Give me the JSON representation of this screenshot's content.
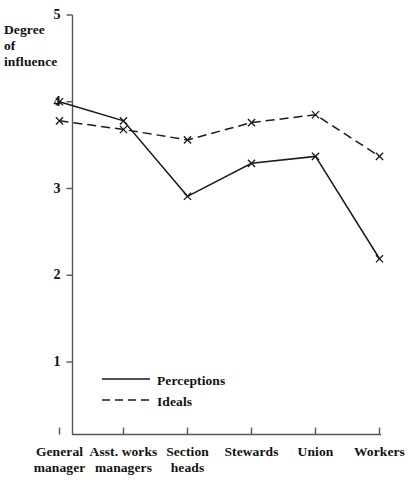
{
  "chart_data": {
    "type": "line",
    "title": "",
    "subtitle": "",
    "xlabel": "",
    "ylabel": "Degree\nof\ninfluence",
    "ylabel_lines": [
      "Degree",
      "of",
      "influence"
    ],
    "categories": [
      "General\nmanager",
      "Asst. works\nmanagers",
      "Section\nheads",
      "Stewards",
      "Union",
      "Workers"
    ],
    "category_lines": [
      [
        "General",
        "manager"
      ],
      [
        "Asst. works",
        "managers"
      ],
      [
        "Section",
        "heads"
      ],
      [
        "Stewards"
      ],
      [
        "Union"
      ],
      [
        "Workers"
      ]
    ],
    "yticks": [
      1,
      2,
      3,
      4,
      5
    ],
    "ytick_labels": [
      "1",
      "2",
      "3",
      "4",
      "5"
    ],
    "ylim": [
      0.55,
      5.0
    ],
    "grid": false,
    "legend_position": "inside-lower-left",
    "marker": "x",
    "series": [
      {
        "name": "Perceptions",
        "style": "solid",
        "color": "#1a1a1a",
        "values": [
          4.0,
          3.78,
          2.91,
          3.29,
          3.37,
          2.19
        ]
      },
      {
        "name": "Ideals",
        "style": "dashed",
        "color": "#1a1a1a",
        "values": [
          3.78,
          3.68,
          3.56,
          3.76,
          3.85,
          3.37
        ]
      }
    ]
  },
  "legend": {
    "items": [
      {
        "label": "Perceptions",
        "style": "solid"
      },
      {
        "label": "Ideals",
        "style": "dashed"
      }
    ]
  },
  "colors": {
    "ink": "#1a1a1a",
    "axis": "#555555",
    "background": "#ffffff"
  }
}
